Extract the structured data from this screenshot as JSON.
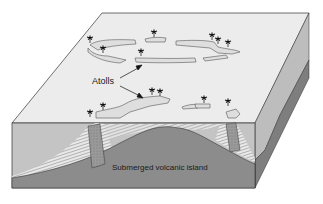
{
  "diagram": {
    "type": "block-diagram",
    "labels": {
      "atolls": "Atolls",
      "volcano": "Submerged volcanic island"
    },
    "colors": {
      "background": "#ffffff",
      "top_surface": "#ececec",
      "sea_water": "#c4c4c4",
      "volcano": "#8c8c8c",
      "right_face_upper": "#b8b8b8",
      "right_face_lower": "#7e7e7e",
      "reef": "#a9a9a9",
      "outline": "#333333"
    },
    "elements": [
      "atoll-ring-distant",
      "atoll-ring-near",
      "palm-trees",
      "coral-reef-columns",
      "reef-sediment-slopes",
      "submerged-volcano-cross-section"
    ]
  }
}
